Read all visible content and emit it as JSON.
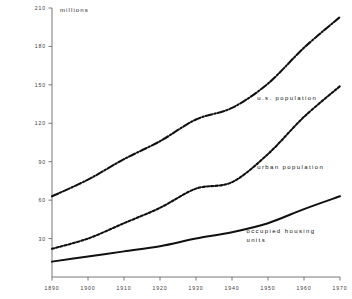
{
  "chart_data": {
    "type": "line",
    "title": "",
    "subtitle": "",
    "xlabel": "",
    "ylabel": "millions",
    "unit_label": "millions",
    "x": [
      1890,
      1900,
      1910,
      1920,
      1930,
      1940,
      1950,
      1960,
      1970
    ],
    "xlim": [
      1890,
      1970
    ],
    "ylim": [
      0,
      210
    ],
    "grid": false,
    "legend_position": "inline-annotations",
    "xticks": [
      "1890",
      "1900",
      "1910",
      "1920",
      "1930",
      "1940",
      "1950",
      "1960",
      "1970"
    ],
    "yticks": [
      "30",
      "60",
      "90",
      "120",
      "150",
      "180",
      "210"
    ],
    "ytick_values": [
      30,
      60,
      90,
      120,
      150,
      180,
      210
    ],
    "series": [
      {
        "name": "u.s. population",
        "label": "u.s. population",
        "style": "dash-dot",
        "color": "#101010",
        "values": [
          63,
          76,
          92,
          106,
          123,
          132,
          151,
          179,
          203
        ]
      },
      {
        "name": "urban population",
        "label": "urban population",
        "style": "dotted",
        "color": "#101010",
        "values": [
          22,
          30,
          42,
          54,
          69,
          74,
          96,
          125,
          149
        ]
      },
      {
        "name": "occupied housing units",
        "label_line1": "occupied housing",
        "label_line2": "units",
        "label": "occupied housing units",
        "style": "solid",
        "color": "#101010",
        "values": [
          12,
          16,
          20,
          24,
          30,
          35,
          42,
          53,
          63
        ]
      }
    ],
    "annotations": [
      {
        "text": "u.s. population",
        "x": 1947,
        "y": 138
      },
      {
        "text": "urban population",
        "x": 1947,
        "y": 84
      },
      {
        "text": "occupied housing",
        "x": 1944,
        "y": 34
      },
      {
        "text": "units",
        "x": 1944,
        "y": 27
      }
    ]
  }
}
